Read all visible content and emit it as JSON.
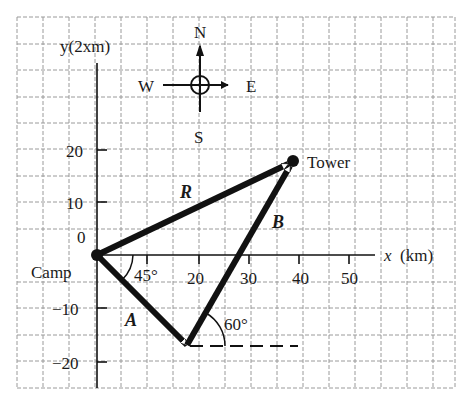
{
  "diagram": {
    "type": "vector-displacement-diagram",
    "axes": {
      "y_label": "y(2xm)",
      "x_label_var": "x",
      "x_label_unit": "(km)",
      "x_ticks": [
        "20",
        "30",
        "40",
        "50"
      ],
      "y_ticks": [
        "20",
        "10",
        "0",
        "−10",
        "−20"
      ]
    },
    "compass": {
      "north": "N",
      "south": "S",
      "east": "E",
      "west": "W"
    },
    "points": {
      "origin": "Camp",
      "destination": "Tower"
    },
    "vectors": {
      "a": "A",
      "b": "B",
      "r": "R"
    },
    "angles": {
      "a_angle": "45°",
      "b_angle": "60°"
    },
    "colors": {
      "ink": "#111111",
      "grid": "#9a9a9a",
      "background": "#ffffff"
    }
  }
}
